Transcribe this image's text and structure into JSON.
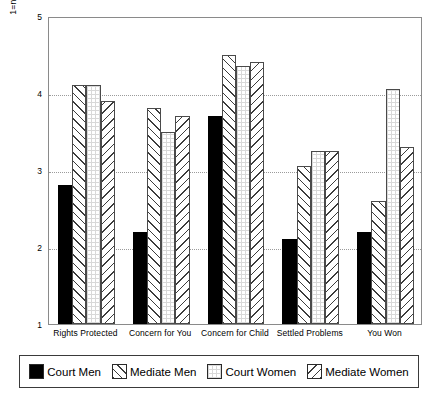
{
  "chart_data": {
    "type": "bar",
    "title": "",
    "xlabel": "",
    "ylabel": "1=not at all; 2=a little; 3=somewhat; 4=quite a bit; 5=very much",
    "ylim": [
      1,
      5
    ],
    "yticks": [
      1,
      2,
      3,
      4,
      5
    ],
    "ytick_labels": [
      "1",
      "2",
      "3",
      "4",
      "5"
    ],
    "grid": true,
    "grid_axis": "y",
    "legend_position": "bottom",
    "categories": [
      "Rights Protected",
      "Concern for You",
      "Concern for Child",
      "Settled Problems",
      "You Won"
    ],
    "series": [
      {
        "name": "Court Men",
        "fill": "solid-black",
        "values": [
          2.8,
          2.2,
          3.7,
          2.1,
          2.2
        ]
      },
      {
        "name": "Mediate Men",
        "fill": "forward-diagonal-hatch",
        "values": [
          4.1,
          3.8,
          4.5,
          3.05,
          2.6
        ]
      },
      {
        "name": "Court Women",
        "fill": "white-dotted",
        "values": [
          4.1,
          3.5,
          4.35,
          3.25,
          4.05
        ]
      },
      {
        "name": "Mediate Women",
        "fill": "backward-diagonal-hatch",
        "values": [
          3.9,
          3.7,
          4.4,
          3.25,
          3.3
        ]
      }
    ]
  },
  "legend": {
    "items": [
      {
        "label": "Court Men",
        "fill": "solid-black"
      },
      {
        "label": "Mediate Men",
        "fill": "forward-diagonal-hatch"
      },
      {
        "label": "Court Women",
        "fill": "white-dotted"
      },
      {
        "label": "Mediate Women",
        "fill": "backward-diagonal-hatch"
      }
    ]
  },
  "colors": {
    "bar_outline": "#4a4a4a",
    "frame": "#8a8a8a",
    "grid": "#9b9b9b",
    "solid_bar": "#000000",
    "background": "#ffffff"
  }
}
